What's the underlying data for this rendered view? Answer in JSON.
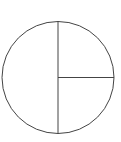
{
  "figure": {
    "name": "circle-fraction-diagram",
    "background_color": "#ffffff",
    "stroke_color": "#444444",
    "fill_color": "#ffffff",
    "stroke_width": 1,
    "canvas": {
      "width": 121,
      "height": 142
    }
  },
  "circle": {
    "name": "outer-circle",
    "center_x": 58,
    "center_y": 77.5,
    "radius": 56
  },
  "lines": [
    {
      "name": "vertical-diameter",
      "label": "vertical diameter",
      "x1": 58,
      "y1": 21.5,
      "x2": 58,
      "y2": 133.5
    },
    {
      "name": "horizontal-radius-right",
      "label": "horizontal radius to right edge",
      "x1": 58,
      "y1": 77.5,
      "x2": 114,
      "y2": 77.5
    }
  ],
  "regions": [
    {
      "name": "left-half",
      "label": "left half",
      "share": "1/2"
    },
    {
      "name": "upper-right-quarter",
      "label": "upper right quarter",
      "share": "1/4"
    },
    {
      "name": "lower-right-quarter",
      "label": "lower right quarter",
      "share": "1/4"
    }
  ]
}
